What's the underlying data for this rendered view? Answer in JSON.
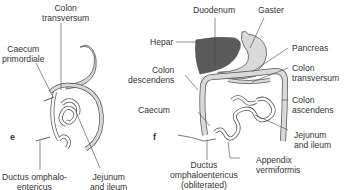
{
  "panels": [
    {
      "letter": "e",
      "labels": {
        "colon_transversum": [
          "Colon",
          "transversum"
        ],
        "caecum_primordiale": [
          "Caecum",
          "primordiale"
        ],
        "ductus": [
          "Ductus omphalo-",
          "entericus"
        ],
        "jejunum": [
          "Jejunum",
          "and ileum"
        ]
      }
    },
    {
      "letter": "f",
      "labels": {
        "duodenum": "Duodenum",
        "gaster": "Gaster",
        "hepar": "Hepar",
        "pancreas": "Pancreas",
        "colon_transversum": [
          "Colon",
          "transversum"
        ],
        "colon_descendens": [
          "Colon",
          "descendens"
        ],
        "colon_ascendens": [
          "Colon",
          "ascendens"
        ],
        "caecum": "Caecum",
        "jejunum": [
          "Jejunum",
          "and ileum"
        ],
        "ductus": [
          "Ductus",
          "omphaloentericus",
          "(obliterated)"
        ],
        "appendix": [
          "Appendix",
          "vermiformis"
        ]
      }
    }
  ],
  "colors": {
    "organ_fill": "#d9d9d9",
    "liver_fill": "#5a5a5a",
    "outline": "#555555",
    "line": "#444444"
  }
}
